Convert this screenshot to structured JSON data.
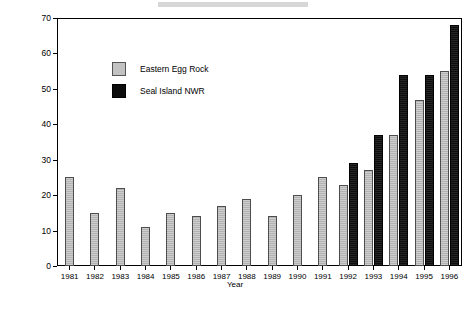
{
  "chart_data": {
    "type": "bar",
    "title": "",
    "xlabel": "Year",
    "ylabel": "Percent of non-translocated nesting Atlantic Puffins",
    "categories": [
      "1981",
      "1982",
      "1983",
      "1984",
      "1985",
      "1986",
      "1987",
      "1988",
      "1989",
      "1990",
      "1991",
      "1992",
      "1993",
      "1994",
      "1995",
      "1996"
    ],
    "ylim": [
      0,
      70
    ],
    "yticks": [
      0,
      10,
      20,
      30,
      40,
      50,
      60,
      70
    ],
    "grid": false,
    "legend_position": "upper-left-inside",
    "series": [
      {
        "name": "Eastern Egg Rock",
        "color": "#b3b3b3",
        "values": [
          25,
          15,
          22,
          11,
          15,
          14,
          17,
          19,
          14,
          20,
          25,
          23,
          27,
          37,
          47,
          55
        ]
      },
      {
        "name": "Seal Island NWR",
        "color": "#0d0d0d",
        "values": [
          null,
          null,
          null,
          null,
          null,
          null,
          null,
          null,
          null,
          null,
          null,
          29,
          37,
          54,
          54,
          68
        ]
      }
    ]
  },
  "legend": {
    "items": [
      {
        "label": "Eastern Egg Rock"
      },
      {
        "label": "Seal Island NWR"
      }
    ]
  },
  "axes": {
    "x_title": "Year",
    "y_title": "Percent of non-translocated nesting Atlantic Puffins"
  }
}
